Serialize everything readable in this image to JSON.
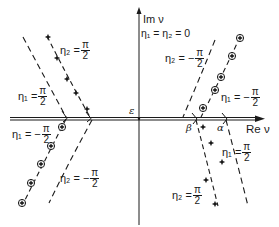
{
  "diagram": {
    "axes": {
      "imaginary_label": "Im ν",
      "real_label": "Re ν",
      "origin_condition": "η₁ = η₂ = 0"
    },
    "points": {
      "epsilon": "ε",
      "beta": "β",
      "alpha": "α"
    },
    "curves": [
      {
        "id": "upper-left-stars",
        "marker": "star",
        "label_lhs": "η₂ =",
        "label_num": "π",
        "label_den": "2",
        "sign": ""
      },
      {
        "id": "upper-left-dashed",
        "marker": "none",
        "label_lhs": "η₁ =",
        "label_num": "π",
        "label_den": "2",
        "sign": ""
      },
      {
        "id": "lower-left-circles",
        "marker": "circled-cross",
        "label_lhs": "η₁ = −",
        "label_num": "π",
        "label_den": "2",
        "sign": "−"
      },
      {
        "id": "lower-left-dashed",
        "marker": "none",
        "label_lhs": "η₂ = −",
        "label_num": "π",
        "label_den": "2",
        "sign": "−"
      },
      {
        "id": "upper-right-dashed",
        "marker": "none",
        "label_lhs": "η₂ = −",
        "label_num": "π",
        "label_den": "2",
        "sign": "−"
      },
      {
        "id": "upper-right-circles",
        "marker": "circled-cross",
        "label_lhs": "η₁ = −",
        "label_num": "π",
        "label_den": "2",
        "sign": "−"
      },
      {
        "id": "lower-right-dashed",
        "marker": "none",
        "label_lhs": "η₁ =",
        "label_num": "π",
        "label_den": "2",
        "sign": ""
      },
      {
        "id": "lower-right-stars",
        "marker": "star",
        "label_lhs": "η₂ =",
        "label_num": "π",
        "label_den": "2",
        "sign": ""
      }
    ],
    "colors": {
      "ink": "#1a1a1a",
      "background": "#ffffff"
    }
  }
}
